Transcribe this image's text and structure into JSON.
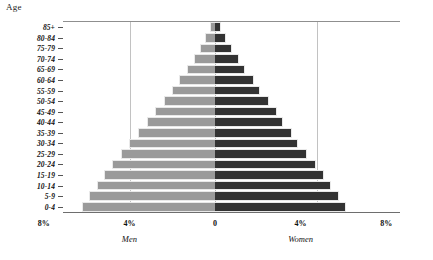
{
  "chart_data": {
    "type": "bar",
    "subtype": "population-pyramid",
    "title": "",
    "ylabel": "Age",
    "xlabel": "",
    "grid": true,
    "legend_position": "below-axis",
    "xlim": [
      -8,
      8
    ],
    "xticks": [
      "8%",
      "4%",
      "0",
      "4%",
      "8%"
    ],
    "xtick_values": [
      -8,
      -4,
      0,
      4,
      8
    ],
    "categories": [
      "0-4",
      "5-9",
      "10-14",
      "15-19",
      "20-24",
      "25-29",
      "30-34",
      "35-39",
      "40-44",
      "45-49",
      "50-54",
      "55-59",
      "60-64",
      "65-69",
      "70-74",
      "75-79",
      "80-84",
      "85+"
    ],
    "series": [
      {
        "name": "Men",
        "side": "left",
        "color": "#9a9a9a",
        "values": [
          6.2,
          5.9,
          5.5,
          5.2,
          4.8,
          4.4,
          4.0,
          3.6,
          3.2,
          2.8,
          2.4,
          2.0,
          1.7,
          1.3,
          1.0,
          0.7,
          0.45,
          0.25
        ]
      },
      {
        "name": "Women",
        "side": "right",
        "color": "#333333",
        "values": [
          6.1,
          5.8,
          5.4,
          5.1,
          4.7,
          4.3,
          3.9,
          3.6,
          3.2,
          2.9,
          2.5,
          2.1,
          1.8,
          1.4,
          1.1,
          0.8,
          0.5,
          0.3
        ]
      }
    ]
  },
  "axes": {
    "y_title": "Age",
    "x_tick_labels": [
      "8%",
      "4%",
      "0",
      "4%",
      "8%"
    ],
    "group_labels": [
      "Men",
      "Women"
    ]
  }
}
